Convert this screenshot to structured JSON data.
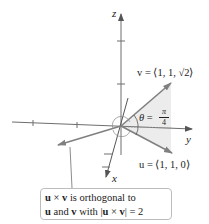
{
  "axes": {
    "x_label": "x",
    "y_label": "y",
    "z_label": "z"
  },
  "vectors": {
    "v": {
      "name": "v",
      "label": "v = ⟨1, 1, √2⟩"
    },
    "u": {
      "name": "u",
      "label": "u = ⟨1, 1, 0⟩"
    }
  },
  "angle": {
    "symbol": "θ",
    "equals": "=",
    "numerator": "π",
    "denominator": "4"
  },
  "annotation": {
    "line1_a": "u",
    "line1_op": " × ",
    "line1_b": "v",
    "line1_rest": " is orthogonal to",
    "line2_a": "u",
    "line2_mid": " and ",
    "line2_b": "v",
    "line2_rest1": " with |",
    "line2_c": "u",
    "line2_op": " × ",
    "line2_d": "v",
    "line2_rest2": "| = 2"
  },
  "colors": {
    "axis": "#6e6e6e",
    "vector": "#7a7a7a",
    "shade": "#ededed",
    "text": "#222222"
  }
}
